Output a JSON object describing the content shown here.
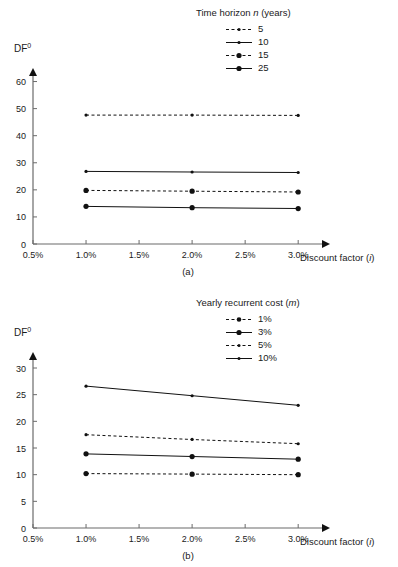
{
  "figures": [
    {
      "id": "a",
      "caption": "(a)",
      "y_axis_label": "DF",
      "y_axis_sup": "0",
      "x_axis_label": "Discount factor (i)",
      "legend_title": "Time horizon n (years)",
      "x_ticks": [
        "0.5%",
        "1.0%",
        "1.5%",
        "2.0%",
        "2.5%",
        "3.0%"
      ],
      "y_ticks": [
        "0",
        "10",
        "20",
        "30",
        "40",
        "50",
        "60"
      ]
    },
    {
      "id": "b",
      "caption": "(b)",
      "y_axis_label": "DF",
      "y_axis_sup": "0",
      "x_axis_label": "Discount factor (i)",
      "legend_title": "Yearly recurrent cost (m)",
      "x_ticks": [
        "0.5%",
        "1.0%",
        "1.5%",
        "2.0%",
        "2.5%",
        "3.0%"
      ],
      "y_ticks": [
        "0",
        "5",
        "10",
        "15",
        "20",
        "25",
        "30"
      ]
    }
  ],
  "chart_data": [
    {
      "type": "line",
      "title": "",
      "panel": "(a)",
      "xlabel": "Discount factor (i)",
      "ylabel": "DF0",
      "legend_title": "Time horizon n (years)",
      "legend_position": "top-right",
      "grid": false,
      "x": [
        1.0,
        2.0,
        3.0
      ],
      "x_tick_labels": [
        "0.5%",
        "1.0%",
        "1.5%",
        "2.0%",
        "2.5%",
        "3.0%"
      ],
      "x_tick_values": [
        0.5,
        1.0,
        1.5,
        2.0,
        2.5,
        3.0
      ],
      "xlim": [
        0.5,
        3.3
      ],
      "y_tick_labels": [
        "0",
        "10",
        "20",
        "30",
        "40",
        "50",
        "60"
      ],
      "ylim": [
        0,
        65
      ],
      "series": [
        {
          "name": "5",
          "values": [
            47.6,
            47.6,
            47.5
          ],
          "style": "dashed",
          "marker": "small-dot"
        },
        {
          "name": "10",
          "values": [
            26.8,
            26.6,
            26.4
          ],
          "style": "solid",
          "marker": "small-dot"
        },
        {
          "name": "15",
          "values": [
            19.8,
            19.5,
            19.2
          ],
          "style": "dashed",
          "marker": "large-dot"
        },
        {
          "name": "25",
          "values": [
            13.9,
            13.4,
            13.1
          ],
          "style": "solid",
          "marker": "large-dot"
        }
      ]
    },
    {
      "type": "line",
      "title": "",
      "panel": "(b)",
      "xlabel": "Discount factor (i)",
      "ylabel": "DF0",
      "legend_title": "Yearly recurrent cost (m)",
      "legend_position": "top-right",
      "grid": false,
      "x": [
        1.0,
        2.0,
        3.0
      ],
      "x_tick_labels": [
        "0.5%",
        "1.0%",
        "1.5%",
        "2.0%",
        "2.5%",
        "3.0%"
      ],
      "x_tick_values": [
        0.5,
        1.0,
        1.5,
        2.0,
        2.5,
        3.0
      ],
      "xlim": [
        0.5,
        3.3
      ],
      "y_tick_labels": [
        "0",
        "5",
        "10",
        "15",
        "20",
        "25",
        "30"
      ],
      "ylim": [
        0,
        33
      ],
      "series": [
        {
          "name": "1%",
          "values": [
            10.2,
            10.1,
            10.0
          ],
          "style": "dashed",
          "marker": "large-dot"
        },
        {
          "name": "3%",
          "values": [
            13.9,
            13.4,
            12.9
          ],
          "style": "solid",
          "marker": "large-dot"
        },
        {
          "name": "5%",
          "values": [
            17.5,
            16.6,
            15.8
          ],
          "style": "dashed",
          "marker": "small-dot"
        },
        {
          "name": "10%",
          "values": [
            26.6,
            24.8,
            23.0
          ],
          "style": "solid",
          "marker": "small-dot"
        }
      ]
    }
  ]
}
